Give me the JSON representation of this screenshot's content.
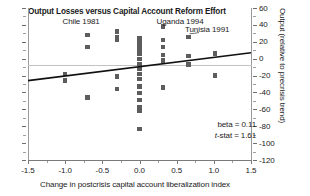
{
  "chart_data": {
    "type": "scatter",
    "title": "Output Losses versus Capital Account Reform Effort",
    "xlabel": "Change in postcrisis capital account liberalization index",
    "ylabel": "Output (relative to precrisis trend)",
    "xlim": [
      -1.5,
      1.5
    ],
    "ylim": [
      -120,
      60
    ],
    "x_ticks": [
      "-1.5",
      "-1.0",
      "-0.5",
      "0.0",
      "0.5",
      "1.0",
      "1.5"
    ],
    "x_tick_values": [
      -1.5,
      -1.0,
      -0.5,
      0.0,
      0.5,
      1.0,
      1.5
    ],
    "y_ticks": [
      "60",
      "40",
      "20",
      "0",
      "-20",
      "-40",
      "-60",
      "-80",
      "-100",
      "-120"
    ],
    "y_tick_values": [
      60,
      40,
      20,
      0,
      -20,
      -40,
      -60,
      -80,
      -100,
      -120
    ],
    "grid": false,
    "zero_line": true,
    "legend": "none",
    "marker": "square",
    "marker_color": "#5d5d5d",
    "points": [
      {
        "x": -1.0,
        "y": -18
      },
      {
        "x": -1.0,
        "y": -26
      },
      {
        "x": -0.7,
        "y": 28
      },
      {
        "x": -0.7,
        "y": 14
      },
      {
        "x": -0.7,
        "y": -46
      },
      {
        "x": -0.3,
        "y": 32
      },
      {
        "x": -0.3,
        "y": 26
      },
      {
        "x": -0.3,
        "y": 22
      },
      {
        "x": -0.3,
        "y": -21
      },
      {
        "x": -0.3,
        "y": -36
      },
      {
        "x": 0.0,
        "y": 24
      },
      {
        "x": 0.0,
        "y": 18
      },
      {
        "x": 0.0,
        "y": 12
      },
      {
        "x": 0.0,
        "y": 6
      },
      {
        "x": 0.0,
        "y": 0
      },
      {
        "x": 0.0,
        "y": -6
      },
      {
        "x": 0.0,
        "y": -12
      },
      {
        "x": 0.0,
        "y": -18
      },
      {
        "x": 0.0,
        "y": -24
      },
      {
        "x": 0.0,
        "y": -33
      },
      {
        "x": 0.0,
        "y": -41
      },
      {
        "x": 0.0,
        "y": -49
      },
      {
        "x": 0.0,
        "y": -57
      },
      {
        "x": 0.0,
        "y": -62
      },
      {
        "x": 0.0,
        "y": -83
      },
      {
        "x": 0.32,
        "y": 38
      },
      {
        "x": 0.32,
        "y": 22
      },
      {
        "x": 0.32,
        "y": 14
      },
      {
        "x": 0.32,
        "y": 4
      },
      {
        "x": 0.32,
        "y": -2
      },
      {
        "x": 0.32,
        "y": -34
      },
      {
        "x": 0.66,
        "y": 26
      },
      {
        "x": 0.66,
        "y": 3
      },
      {
        "x": 0.66,
        "y": -7
      },
      {
        "x": 1.02,
        "y": 6
      },
      {
        "x": 1.02,
        "y": -20
      }
    ],
    "fit_line": {
      "beta": 0.11,
      "y_at_xmin": -26,
      "y_at_xmax": 7
    },
    "annotations": [
      {
        "label": "Chile 1981",
        "x": -0.7,
        "y": 44
      },
      {
        "label": "Uganda 1994",
        "x": 0.27,
        "y": 44
      },
      {
        "label": "Tunisia 1991",
        "x": 0.72,
        "y": 34
      }
    ],
    "stats": {
      "beta_label": "beta = 0.11",
      "tstat_prefix": "t",
      "tstat_rest": "-stat = 1.61"
    }
  }
}
